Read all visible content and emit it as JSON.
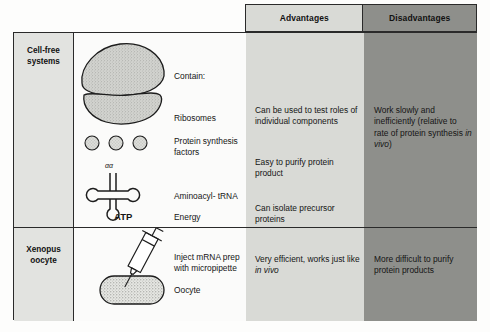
{
  "figure": {
    "header": {
      "advantages_label": "Advantages",
      "disadvantages_label": "Disadvantages",
      "advantages_bg": "#d9dad6",
      "disadvantages_bg": "#8e8f8b"
    },
    "rows": [
      {
        "system_label": "Cell-free\nsystems",
        "system_label_line1": "Cell-free",
        "system_label_line2": "systems",
        "diagram": {
          "contain_label": "Contain:",
          "ribosomes_label": "Ribosomes",
          "factors_label": "Protein synthesis\nfactors",
          "factors_label_line1": "Protein synthesis",
          "factors_label_line2": "factors",
          "trna_aa_label": "αα",
          "trna_label": "Aminoacyl- tRNA",
          "atp_label": "ATP",
          "energy_label": "Energy"
        },
        "advantages": [
          "Can be used to test roles of individual components",
          "Easy to purify protein product",
          "Can isolate precursor proteins"
        ],
        "disadvantages_prefix": "Work slowly and inefficiently (relative to rate of protein synthesis ",
        "disadvantages_italic": "in vivo",
        "disadvantages_suffix": ")"
      },
      {
        "system_label_line1": "Xenopus",
        "system_label_line2": "oocyte",
        "diagram": {
          "inject_label_line1": "Inject mRNA prep",
          "inject_label_line2": "with micropipette",
          "oocyte_label": "Oocyte"
        },
        "advantages_prefix": "Very efficient, works just like ",
        "advantages_italic": "in vivo",
        "advantages_suffix": "",
        "disadvantages": "More difficult to purify protein products"
      }
    ]
  }
}
